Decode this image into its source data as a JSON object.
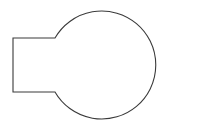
{
  "figure": {
    "shape_name": "circle-rectangle-union",
    "background_color": "#ffffff",
    "fill_color": "#ffffff",
    "stroke_color": "#3a3a3a",
    "stroke_width": 1.1,
    "canvas": {
      "width": 202,
      "height": 134
    },
    "components": [
      {
        "name": "circle",
        "center_x": 101,
        "center_y": 66,
        "radius": 54,
        "top_y": 12,
        "bottom_y": 120,
        "left_x": 47,
        "right_x": 155
      },
      {
        "name": "rectangle",
        "left_x": 13,
        "right_x": 191,
        "top_y": 38,
        "bottom_y": 92,
        "width": 178,
        "height": 54
      }
    ],
    "intersections": [
      {
        "name": "top-left-junction",
        "x": 55,
        "y": 38
      },
      {
        "name": "top-right-junction",
        "x": 147,
        "y": 38
      },
      {
        "name": "bottom-right-junction",
        "x": 147,
        "y": 92
      },
      {
        "name": "bottom-left-junction",
        "x": 55,
        "y": 92
      }
    ],
    "outline_path": "M 55 38 L 13 38 L 13 92 L 55 92 A 54 54 0 1 0 55 38 Z"
  }
}
